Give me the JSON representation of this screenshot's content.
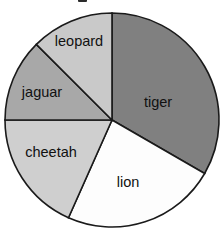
{
  "chart_data": {
    "type": "pie",
    "title": "",
    "xlabel": "",
    "ylabel": "",
    "legend_position": "none",
    "labels_inside": true,
    "start_angle_deg": 0,
    "direction": "clockwise",
    "categories": [
      "tiger",
      "lion",
      "cheetah",
      "jaguar",
      "leopard"
    ],
    "values": [
      33.3,
      23.3,
      18.3,
      12.5,
      12.6
    ],
    "units": "percent",
    "slices": [
      {
        "label": "tiger",
        "value": 33.3,
        "start_deg": 0,
        "end_deg": 120,
        "sweep_deg": 120,
        "color": "#808080",
        "label_x": 158,
        "label_y": 103
      },
      {
        "label": "lion",
        "value": 23.3,
        "start_deg": 120,
        "end_deg": 204,
        "sweep_deg": 84,
        "color": "#fdfdfd",
        "label_x": 128,
        "label_y": 183
      },
      {
        "label": "cheetah",
        "value": 18.3,
        "start_deg": 204,
        "end_deg": 270,
        "sweep_deg": 66,
        "color": "#cfcfcf",
        "label_x": 51,
        "label_y": 153
      },
      {
        "label": "jaguar",
        "value": 12.5,
        "start_deg": 270,
        "end_deg": 315,
        "sweep_deg": 45,
        "color": "#a8a8a8",
        "label_x": 42,
        "label_y": 93
      },
      {
        "label": "leopard",
        "value": 12.6,
        "start_deg": 315,
        "end_deg": 360,
        "sweep_deg": 45,
        "color": "#c9c9c9",
        "label_x": 79,
        "label_y": 42
      }
    ],
    "geometry": {
      "center_x": 112,
      "center_y": 120,
      "radius": 107,
      "outline_color": "#1a1a1a",
      "background": "#ffffff"
    }
  }
}
